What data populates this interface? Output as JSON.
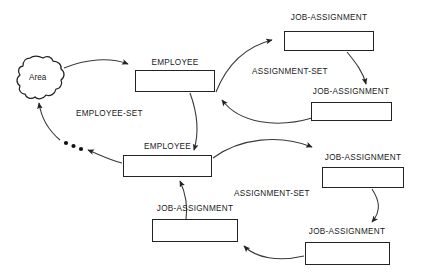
{
  "diagram": {
    "background_color": "#ffffff",
    "line_color": "#232323",
    "text_color": "#1a1a1a",
    "area_node": {
      "label": "Area",
      "shape": "cloud-blob",
      "x": 18,
      "y": 57,
      "width": 48,
      "height": 44
    },
    "entities": [
      {
        "id": "employee-1",
        "label": "EMPLOYEE",
        "box": {
          "x": 135,
          "y": 70,
          "width": 80,
          "height": 22
        },
        "label_pos": {
          "x": 135,
          "y": 58,
          "width": 80
        }
      },
      {
        "id": "job-assignment-1",
        "label": "JOB-ASSIGNMENT",
        "box": {
          "x": 284,
          "y": 31,
          "width": 90,
          "height": 20
        },
        "label_pos": {
          "x": 284,
          "y": 13,
          "width": 90
        }
      },
      {
        "id": "job-assignment-2",
        "label": "JOB-ASSIGNMENT",
        "box": {
          "x": 311,
          "y": 102,
          "width": 81,
          "height": 19
        },
        "label_pos": {
          "x": 306,
          "y": 87,
          "width": 90
        }
      },
      {
        "id": "employee-2",
        "label": "EMPLOYEE",
        "box": {
          "x": 123,
          "y": 155,
          "width": 89,
          "height": 22
        },
        "label_pos": {
          "x": 123,
          "y": 142,
          "width": 89
        }
      },
      {
        "id": "job-assignment-3",
        "label": "JOB-ASSIGNMENT",
        "box": {
          "x": 322,
          "y": 167,
          "width": 82,
          "height": 21
        },
        "label_pos": {
          "x": 318,
          "y": 153,
          "width": 90
        }
      },
      {
        "id": "job-assignment-4",
        "label": "JOB-ASSIGNMENT",
        "box": {
          "x": 152,
          "y": 219,
          "width": 86,
          "height": 23
        },
        "label_pos": {
          "x": 150,
          "y": 204,
          "width": 90
        }
      },
      {
        "id": "job-assignment-5",
        "label": "JOB-ASSIGNMENT",
        "box": {
          "x": 305,
          "y": 242,
          "width": 85,
          "height": 23
        },
        "label_pos": {
          "x": 302,
          "y": 227,
          "width": 90
        }
      }
    ],
    "set_labels": [
      {
        "id": "employee-set",
        "label": "EMPLOYEE-SET",
        "x": 76,
        "y": 109
      },
      {
        "id": "assignment-set-top",
        "label": "ASSIGNMENT-SET",
        "x": 252,
        "y": 67
      },
      {
        "id": "assignment-set-bottom",
        "label": "ASSIGNMENT-SET",
        "x": 234,
        "y": 189
      }
    ],
    "ellipsis": {
      "id": "employee-set-continuation-dots",
      "count": 3,
      "points": [
        {
          "x": 66,
          "y": 143
        },
        {
          "x": 73,
          "y": 146
        },
        {
          "x": 80,
          "y": 149
        }
      ]
    },
    "connectors": [
      {
        "id": "area-to-employee-1",
        "from": "area",
        "to": "employee-1",
        "style": "curved-arrow"
      },
      {
        "id": "employee-1-to-job-assignment-1",
        "from": "employee-1",
        "to": "job-assignment-1",
        "style": "curved-arrow"
      },
      {
        "id": "employee-1-to-job-assignment-2",
        "from": "employee-1",
        "to": "job-assignment-2",
        "style": "curved-arrow"
      },
      {
        "id": "job-assignment-1-to-job-assignment-2",
        "from": "job-assignment-1",
        "to": "job-assignment-2",
        "style": "curved-arrow"
      },
      {
        "id": "job-assignment-2-to-employee-1",
        "from": "job-assignment-2",
        "to": "employee-1",
        "style": "curved-arrow"
      },
      {
        "id": "employee-1-to-employee-2",
        "from": "employee-1",
        "to": "employee-2",
        "style": "curved-arrow"
      },
      {
        "id": "employee-2-to-area",
        "from": "employee-2",
        "to": "area",
        "style": "curved-arrow-dotted-continuation"
      },
      {
        "id": "employee-2-to-job-assignment-3",
        "from": "employee-2",
        "to": "job-assignment-3",
        "style": "curved-arrow"
      },
      {
        "id": "job-assignment-3-to-job-assignment-5",
        "from": "job-assignment-3",
        "to": "job-assignment-5",
        "style": "curved-arrow"
      },
      {
        "id": "job-assignment-5-to-job-assignment-4",
        "from": "job-assignment-5",
        "to": "job-assignment-4",
        "style": "curved-arrow"
      },
      {
        "id": "job-assignment-4-to-employee-2",
        "from": "job-assignment-4",
        "to": "employee-2",
        "style": "curved-arrow"
      }
    ]
  }
}
